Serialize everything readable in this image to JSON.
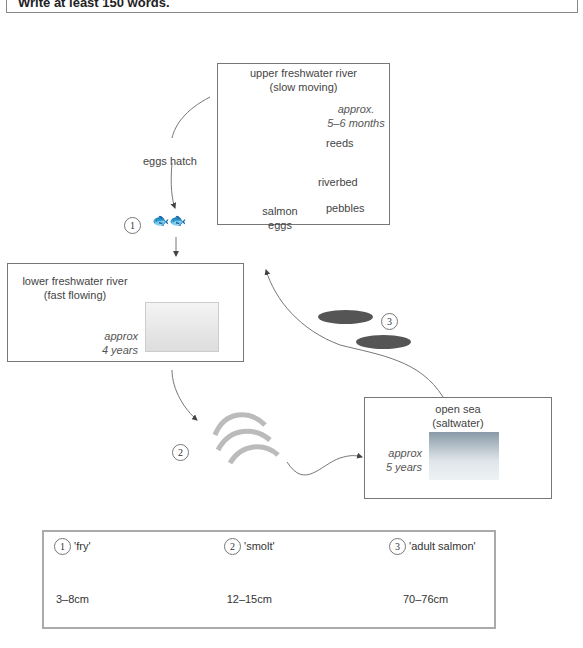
{
  "header": {
    "instruction": "Write at least 150 words."
  },
  "stages": {
    "upper": {
      "title1": "upper freshwater river",
      "title2": "(slow moving)",
      "duration1": "approx.",
      "duration2": "5–6 months",
      "labels": {
        "reeds": "reeds",
        "riverbed": "riverbed",
        "pebbles": "pebbles",
        "eggs1": "salmon",
        "eggs2": "eggs"
      }
    },
    "lower": {
      "title1": "lower freshwater river",
      "title2": "(fast flowing)",
      "duration1": "approx",
      "duration2": "4 years"
    },
    "sea": {
      "title1": "open sea",
      "title2": "(saltwater)",
      "duration1": "approx",
      "duration2": "5 years"
    }
  },
  "transitions": {
    "hatch": "eggs hatch"
  },
  "markers": {
    "one": "1",
    "two": "2",
    "three": "3"
  },
  "legend": {
    "items": [
      {
        "num": "1",
        "name": "'fry'",
        "size": "3–8cm"
      },
      {
        "num": "2",
        "name": "'smolt'",
        "size": "12–15cm"
      },
      {
        "num": "3",
        "name": "'adult salmon'",
        "size": "70–76cm"
      }
    ]
  }
}
